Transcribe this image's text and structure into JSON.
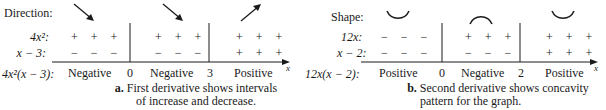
{
  "panel_a": {
    "row_header": "Direction:",
    "factor1_label": "4x²:",
    "factor2_label": "x − 3:",
    "product_label": "4x²(x − 3):",
    "critical_points": [
      "0",
      "3"
    ],
    "intervals": [
      {
        "direction": "down-right-arrow",
        "factor1": "+ + +",
        "factor2": "− − −",
        "result": "Negative"
      },
      {
        "direction": "down-right-arrow",
        "factor1": "+ + +",
        "factor2": "− − −",
        "result": "Negative"
      },
      {
        "direction": "up-right-arrow",
        "factor1": "+ + +",
        "factor2": "+ + +",
        "result": "Positive"
      }
    ],
    "axis_label": "x",
    "caption_bold": "a.",
    "caption_line1": "First derivative shows intervals",
    "caption_line2": "of increase and decrease."
  },
  "panel_b": {
    "row_header": "Shape:",
    "factor1_label": "12x:",
    "factor2_label": "x − 2:",
    "product_label": "12x(x − 2):",
    "critical_points": [
      "0",
      "2"
    ],
    "intervals": [
      {
        "shape": "concave-up",
        "factor1": "− − −",
        "factor2": "− − −",
        "result": "Positive"
      },
      {
        "shape": "concave-down",
        "factor1": "+ + +",
        "factor2": "− − −",
        "result": "Negative"
      },
      {
        "shape": "concave-up",
        "factor1": "+ + +",
        "factor2": "+ + +",
        "result": "Positive"
      }
    ],
    "axis_label": "x",
    "caption_bold": "b.",
    "caption_line1": "Second derivative shows concavity",
    "caption_line2": "pattern for the graph."
  }
}
